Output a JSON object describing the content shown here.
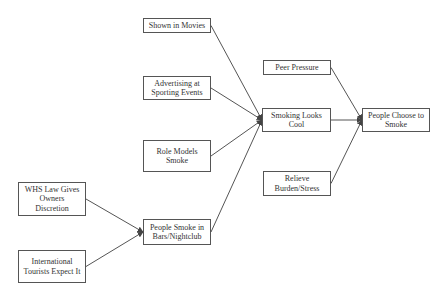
{
  "diagram": {
    "type": "causal-flow",
    "colors": {
      "line": "#555555",
      "text": "#333333",
      "background": "#ffffff"
    },
    "nodes": [
      {
        "id": "movies",
        "label": "Shown in Movies",
        "x": 143,
        "y": 18,
        "w": 68,
        "h": 15
      },
      {
        "id": "advertising",
        "label": "Advertising at Sporting Events",
        "x": 143,
        "y": 76,
        "w": 68,
        "h": 24
      },
      {
        "id": "rolemodels",
        "label": "Role Models Smoke",
        "x": 143,
        "y": 140,
        "w": 68,
        "h": 32
      },
      {
        "id": "whs",
        "label": "WHS Law Gives Owners Discretion",
        "x": 18,
        "y": 182,
        "w": 68,
        "h": 34
      },
      {
        "id": "tourists",
        "label": "International Tourists Expect It",
        "x": 18,
        "y": 250,
        "w": 68,
        "h": 33
      },
      {
        "id": "bars",
        "label": "People Smoke in Bars/Nightclub",
        "x": 143,
        "y": 219,
        "w": 68,
        "h": 26
      },
      {
        "id": "cool",
        "label": "Smoking Looks Cool",
        "x": 262,
        "y": 108,
        "w": 69,
        "h": 24
      },
      {
        "id": "peer",
        "label": "Peer Pressure",
        "x": 263,
        "y": 60,
        "w": 68,
        "h": 15
      },
      {
        "id": "relieve",
        "label": "Relieve Burden/Stress",
        "x": 263,
        "y": 171,
        "w": 68,
        "h": 25
      },
      {
        "id": "choose",
        "label": "People Choose to Smoke",
        "x": 362,
        "y": 108,
        "w": 68,
        "h": 24
      }
    ],
    "edges": [
      {
        "from": "movies",
        "to": "cool"
      },
      {
        "from": "advertising",
        "to": "cool"
      },
      {
        "from": "rolemodels",
        "to": "cool"
      },
      {
        "from": "bars",
        "to": "cool"
      },
      {
        "from": "whs",
        "to": "bars"
      },
      {
        "from": "tourists",
        "to": "bars"
      },
      {
        "from": "peer",
        "to": "choose"
      },
      {
        "from": "cool",
        "to": "choose"
      },
      {
        "from": "relieve",
        "to": "choose"
      }
    ]
  }
}
